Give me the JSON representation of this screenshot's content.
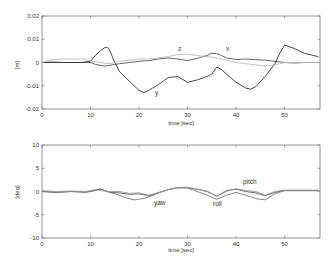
{
  "chart_data": [
    {
      "type": "line",
      "title": "",
      "xlabel": "time [sec]",
      "ylabel": "[m]",
      "xlim": [
        0,
        57.3
      ],
      "ylim": [
        -0.02,
        0.02
      ],
      "xticks": [
        "0",
        "10",
        "20",
        "30",
        "40",
        "50"
      ],
      "yticks": [
        "0.02",
        "0.01",
        "0",
        "-0.01",
        "-0.02"
      ],
      "grid": false,
      "legend": "inline labels",
      "series": [
        {
          "name": "x",
          "color": "#555555",
          "x": [
            0,
            2,
            5,
            8,
            10,
            11,
            12,
            13,
            14,
            15,
            16,
            18,
            20,
            22,
            24,
            26,
            28,
            30,
            32,
            34,
            35,
            36,
            37,
            38,
            40,
            42,
            44,
            46,
            48,
            50,
            52,
            54,
            57
          ],
          "y": [
            0.0,
            0.0002,
            0.0,
            0.0,
            0.0,
            -0.0008,
            -0.0012,
            -0.0015,
            -0.0012,
            -0.0008,
            -0.0005,
            0.0,
            0.0005,
            0.0008,
            0.0015,
            0.002,
            0.0015,
            0.0008,
            0.0018,
            0.003,
            0.004,
            0.0038,
            0.003,
            0.002,
            0.0013,
            0.0015,
            0.0012,
            0.001,
            0.0005,
            0.0,
            -0.0002,
            0.0,
            0.0
          ]
        },
        {
          "name": "y",
          "color": "#333333",
          "x": [
            0,
            2,
            5,
            8,
            10,
            11,
            12,
            13,
            13.5,
            14,
            15,
            16,
            18,
            20,
            21,
            22,
            24,
            26,
            28,
            30,
            32,
            34,
            35,
            36,
            37,
            38,
            40,
            42,
            43,
            44,
            46,
            48,
            49,
            50,
            52,
            54,
            57
          ],
          "y": [
            0.0,
            0.0,
            0.0,
            0.0,
            0.0005,
            0.003,
            0.005,
            0.0065,
            0.0065,
            0.005,
            0.0,
            -0.004,
            -0.008,
            -0.012,
            -0.013,
            -0.012,
            -0.0095,
            -0.0065,
            -0.006,
            -0.0085,
            -0.0075,
            -0.006,
            -0.005,
            -0.002,
            -0.003,
            -0.005,
            -0.0085,
            -0.011,
            -0.0115,
            -0.0105,
            -0.006,
            -0.0005,
            0.004,
            0.0075,
            0.006,
            0.004,
            0.0025
          ]
        },
        {
          "name": "z",
          "color": "#b8b8b8",
          "x": [
            0,
            2,
            5,
            8,
            10,
            12,
            14,
            16,
            18,
            20,
            22,
            24,
            26,
            28,
            30,
            32,
            34,
            36,
            38,
            40,
            42,
            44,
            46,
            48,
            50,
            52,
            54,
            57
          ],
          "y": [
            0.0,
            0.0012,
            0.0015,
            0.0015,
            0.0008,
            0.0,
            -0.0005,
            0.0005,
            0.001,
            0.0015,
            0.0015,
            0.002,
            0.0025,
            0.0035,
            0.0035,
            0.003,
            0.0025,
            0.002,
            0.001,
            0.0,
            -0.0005,
            -0.001,
            -0.0015,
            -0.001,
            0.0,
            0.0,
            0.0,
            0.0
          ]
        }
      ]
    },
    {
      "type": "line",
      "title": "",
      "xlabel": "time [sec]",
      "ylabel": "[deg]",
      "xlim": [
        0,
        57.3
      ],
      "ylim": [
        -10,
        10
      ],
      "xticks": [
        "0",
        "10",
        "20",
        "30",
        "40",
        "50"
      ],
      "yticks": [
        "10",
        "5",
        "0",
        "-5",
        "-10"
      ],
      "grid": false,
      "legend": "inline labels",
      "series": [
        {
          "name": "yaw",
          "color": "#555555",
          "x": [
            0,
            3,
            6,
            9,
            11,
            12,
            14,
            16,
            18,
            20,
            22,
            24,
            26,
            28,
            30,
            32,
            34,
            36,
            38,
            40,
            42,
            44,
            46,
            48,
            50,
            53,
            57
          ],
          "y": [
            0.0,
            -0.2,
            0.0,
            -0.1,
            0.3,
            0.5,
            -0.2,
            -0.3,
            -0.6,
            -0.5,
            -0.9,
            -0.3,
            0.4,
            0.8,
            0.8,
            0.5,
            0.0,
            -1.0,
            0.2,
            0.5,
            0.0,
            -0.3,
            -0.9,
            -0.2,
            0.2,
            0.2,
            0.2
          ]
        },
        {
          "name": "roll",
          "color": "#777777",
          "x": [
            0,
            3,
            6,
            9,
            11,
            12,
            14,
            16,
            17,
            19,
            21,
            23,
            24,
            26,
            28,
            30,
            32,
            34,
            36,
            38,
            40,
            42,
            44,
            46,
            48,
            50,
            53,
            57
          ],
          "y": [
            0.0,
            -0.2,
            0.0,
            -0.2,
            0.2,
            0.6,
            -0.2,
            -0.8,
            -1.3,
            -1.8,
            -1.5,
            -0.8,
            -0.3,
            0.4,
            0.8,
            0.8,
            0.0,
            -0.8,
            -1.7,
            -0.8,
            -0.2,
            -0.8,
            -1.5,
            -1.8,
            -0.5,
            0.2,
            0.2,
            0.2
          ]
        },
        {
          "name": "pitch",
          "color": "#999999",
          "x": [
            0,
            3,
            6,
            9,
            11,
            12,
            14,
            16,
            18,
            20,
            22,
            24,
            26,
            28,
            30,
            32,
            34,
            36,
            38,
            40,
            42,
            44,
            46,
            48,
            50,
            53,
            57
          ],
          "y": [
            0.2,
            0.0,
            0.1,
            0.0,
            0.4,
            0.2,
            0.0,
            0.0,
            -0.4,
            -0.3,
            -0.8,
            -0.2,
            0.4,
            0.9,
            0.9,
            0.5,
            0.1,
            -1.0,
            0.0,
            0.6,
            0.2,
            0.0,
            -0.8,
            0.0,
            0.3,
            0.3,
            0.3
          ]
        }
      ]
    }
  ],
  "top_chart": {
    "ylabel": "[m]",
    "xlabel": "time [sec]",
    "yticks": [
      "0.02",
      "0.01",
      "0",
      "-0.01",
      "-0.02"
    ],
    "xticks": [
      "0",
      "10",
      "20",
      "30",
      "40",
      "50"
    ],
    "labels": {
      "x": "x",
      "y": "y",
      "z": "z"
    }
  },
  "bottom_chart": {
    "ylabel": "[deg]",
    "xlabel": "time [sec]",
    "yticks": [
      "10",
      "5",
      "0",
      "-5",
      "-10"
    ],
    "xticks": [
      "0",
      "10",
      "20",
      "30",
      "40",
      "50"
    ],
    "labels": {
      "yaw": "yaw",
      "roll": "roll",
      "pitch": "pitch"
    }
  }
}
